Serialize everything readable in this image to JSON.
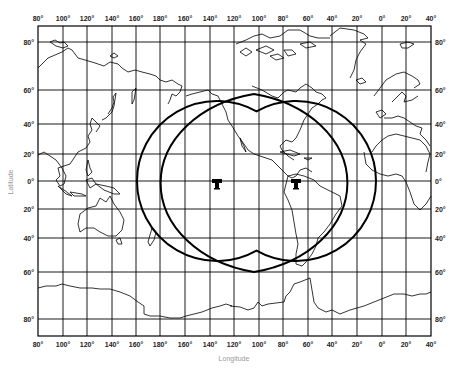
{
  "figure": {
    "type": "world-map-coverage",
    "projection": "Mercator-like rectangular grid",
    "axis_titles": {
      "x": "Longitude",
      "y": "Latitude"
    },
    "longitude_labels": [
      "80°",
      "100°",
      "120°",
      "140°",
      "160°",
      "180°",
      "160°",
      "140°",
      "120°",
      "100°",
      "80°",
      "60°",
      "40°",
      "20°",
      "0°",
      "20°",
      "40°"
    ],
    "latitude_labels_left": [
      "80°",
      "60°",
      "40°",
      "20°",
      "0°",
      "20°",
      "40°",
      "60°",
      "80°"
    ],
    "latitude_labels_right": [
      "80°",
      "60°",
      "40°",
      "20°",
      "0°",
      "20°",
      "40°",
      "60°",
      "80°"
    ],
    "coverage": {
      "description": "Combined coverage footprint of two geostationary satellites",
      "satellites": [
        {
          "name": "satellite-1",
          "icon": "satellite-antenna-icon",
          "longitude": "~140°W",
          "latitude": "0°"
        },
        {
          "name": "satellite-2",
          "icon": "satellite-antenna-icon",
          "longitude": "~75°W",
          "latitude": "0°"
        }
      ],
      "footprint_extent_lat": [
        "60°N",
        "60°S"
      ]
    },
    "colors": {
      "lines": "#000000",
      "background": "#ffffff",
      "axis_title": "#999999"
    }
  }
}
